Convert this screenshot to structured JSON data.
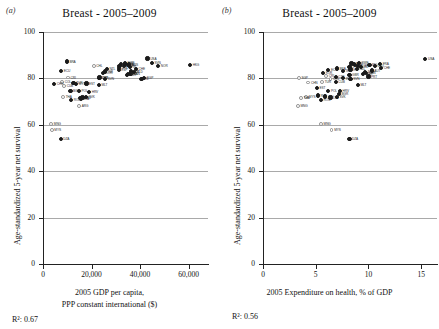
{
  "figure": {
    "panels": [
      {
        "letter": "(a)",
        "title": "Breast - 2005–2009",
        "rsq_text": "R²: 0.67",
        "xlabel_line1": "2005 GDP per capita,",
        "xlabel_line2": "PPP constant international ($)"
      },
      {
        "letter": "(b)",
        "title": "Breast - 2005–2009",
        "rsq_text": "R²: 0.56",
        "xlabel_line1": "2005 Expenditure on health, % of GDP",
        "xlabel_line2": ""
      }
    ],
    "ylabel": "Age-standardized 5-year net survival"
  },
  "chart_data": [
    {
      "type": "scatter",
      "panel": "a",
      "title": "Breast - 2005–2009",
      "xlabel": "2005 GDP per capita, PPP constant international ($)",
      "ylabel": "Age-standardized 5-year net survival",
      "xlim": [
        0,
        68000
      ],
      "ylim": [
        0,
        100
      ],
      "xticks": [
        0,
        20000,
        40000,
        60000
      ],
      "xtick_labels": [
        "0",
        "20,000",
        "40,000",
        "60,000"
      ],
      "yticks": [
        0,
        20,
        40,
        60,
        80,
        100
      ],
      "ytick_labels": [
        "0",
        "20",
        "40",
        "60",
        "80",
        "100"
      ],
      "grid": "horizontal",
      "legend": "none",
      "annotation": "R²: 0.67",
      "r_squared": 0.67,
      "points": [
        {
          "label": "BRA",
          "x": 9800,
          "y": 87.3,
          "marker": "filled"
        },
        {
          "label": "ECU",
          "x": 7500,
          "y": 83.2,
          "marker": "filled"
        },
        {
          "label": "CRI",
          "x": 10300,
          "y": 80.4,
          "marker": "open"
        },
        {
          "label": "COL",
          "x": 7900,
          "y": 78.5,
          "marker": "open"
        },
        {
          "label": "CHN",
          "x": 4600,
          "y": 77.5,
          "marker": "filled"
        },
        {
          "label": "CUB",
          "x": 8700,
          "y": 76.8,
          "marker": "open"
        },
        {
          "label": "TUR",
          "x": 12600,
          "y": 78.0,
          "marker": "filled"
        },
        {
          "label": "MYS",
          "x": 13700,
          "y": 77.6,
          "marker": "filled"
        },
        {
          "label": "EST",
          "x": 17900,
          "y": 77.8,
          "marker": "filled"
        },
        {
          "label": "POL",
          "x": 14800,
          "y": 74.5,
          "marker": "filled"
        },
        {
          "label": "BGR",
          "x": 11300,
          "y": 74.6,
          "marker": "filled"
        },
        {
          "label": "THA",
          "x": 8300,
          "y": 72.0,
          "marker": "open"
        },
        {
          "label": "RUS",
          "x": 15100,
          "y": 71.4,
          "marker": "filled"
        },
        {
          "label": "LVA",
          "x": 15700,
          "y": 71.0,
          "marker": "filled"
        },
        {
          "label": "LTU",
          "x": 16300,
          "y": 71.8,
          "marker": "filled"
        },
        {
          "label": "SVK",
          "x": 17800,
          "y": 71.9,
          "marker": "filled"
        },
        {
          "label": "ROU",
          "x": 11600,
          "y": 70.6,
          "marker": "filled"
        },
        {
          "label": "MNG",
          "x": 3400,
          "y": 60.2,
          "marker": "open"
        },
        {
          "label": "MYS",
          "x": 3600,
          "y": 57.9,
          "marker": "open"
        },
        {
          "label": "DZA",
          "x": 7300,
          "y": 53.8,
          "marker": "filled"
        },
        {
          "label": "ARG",
          "x": 14900,
          "y": 68.0,
          "marker": "open"
        },
        {
          "label": "CHL",
          "x": 20900,
          "y": 85.5,
          "marker": "open"
        },
        {
          "label": "KOR",
          "x": 24800,
          "y": 82.3,
          "marker": "filled"
        },
        {
          "label": "ISR",
          "x": 25700,
          "y": 83.0,
          "marker": "filled"
        },
        {
          "label": "CZE",
          "x": 23200,
          "y": 80.2,
          "marker": "filled"
        },
        {
          "label": "PRT",
          "x": 23300,
          "y": 80.4,
          "marker": "filled"
        },
        {
          "label": "SVN",
          "x": 25600,
          "y": 79.9,
          "marker": "filled"
        },
        {
          "label": "MLT",
          "x": 23000,
          "y": 77.2,
          "marker": "filled"
        },
        {
          "label": "HRV",
          "x": 19000,
          "y": 74.2,
          "marker": "filled"
        },
        {
          "label": "ESP",
          "x": 31200,
          "y": 83.6,
          "marker": "filled"
        },
        {
          "label": "ITA",
          "x": 31500,
          "y": 85.5,
          "marker": "filled"
        },
        {
          "label": "FRA",
          "x": 32000,
          "y": 86.1,
          "marker": "filled"
        },
        {
          "label": "DEU",
          "x": 33500,
          "y": 85.4,
          "marker": "filled"
        },
        {
          "label": "FIN",
          "x": 33900,
          "y": 86.3,
          "marker": "filled"
        },
        {
          "label": "GBR",
          "x": 34500,
          "y": 81.5,
          "marker": "filled"
        },
        {
          "label": "JPN",
          "x": 31400,
          "y": 84.6,
          "marker": "filled"
        },
        {
          "label": "BEL",
          "x": 35000,
          "y": 85.7,
          "marker": "filled"
        },
        {
          "label": "AUT",
          "x": 36200,
          "y": 83.0,
          "marker": "filled"
        },
        {
          "label": "NZL",
          "x": 26300,
          "y": 84.0,
          "marker": "filled"
        },
        {
          "label": "AUS",
          "x": 35500,
          "y": 86.0,
          "marker": "filled"
        },
        {
          "label": "CAN",
          "x": 36100,
          "y": 82.0,
          "marker": "filled"
        },
        {
          "label": "DNK",
          "x": 35200,
          "y": 81.8,
          "marker": "filled"
        },
        {
          "label": "NLD",
          "x": 37500,
          "y": 82.6,
          "marker": "filled"
        },
        {
          "label": "ISL",
          "x": 35800,
          "y": 84.9,
          "marker": "filled"
        },
        {
          "label": "CHE",
          "x": 38300,
          "y": 84.2,
          "marker": "filled"
        },
        {
          "label": "IRL",
          "x": 40600,
          "y": 79.9,
          "marker": "filled"
        },
        {
          "label": "SWE",
          "x": 33800,
          "y": 86.5,
          "marker": "filled"
        },
        {
          "label": "SVN",
          "x": 44900,
          "y": 86.6,
          "marker": "filled"
        },
        {
          "label": "USA",
          "x": 43100,
          "y": 88.6,
          "marker": "filled"
        },
        {
          "label": "NOR",
          "x": 47500,
          "y": 85.2,
          "marker": "filled"
        },
        {
          "label": "HKG",
          "x": 60600,
          "y": 85.9,
          "marker": "filled"
        },
        {
          "label": "SGP",
          "x": 41700,
          "y": 80.3,
          "marker": "filled"
        }
      ]
    },
    {
      "type": "scatter",
      "panel": "b",
      "title": "Breast - 2005–2009",
      "xlabel": "2005 Expenditure on health, % of GDP",
      "ylabel": "Age-standardized 5-year net survival",
      "xlim": [
        0,
        16.5
      ],
      "ylim": [
        0,
        100
      ],
      "xticks": [
        0,
        5,
        10,
        15
      ],
      "xtick_labels": [
        "0",
        "5",
        "10",
        "15"
      ],
      "yticks": [
        0,
        20,
        40,
        60,
        80,
        100
      ],
      "ytick_labels": [
        "0",
        "20",
        "40",
        "60",
        "80",
        "100"
      ],
      "grid": "horizontal",
      "legend": "none",
      "annotation": "R²: 0.56",
      "r_squared": 0.56,
      "points": [
        {
          "label": "USA",
          "x": 15.4,
          "y": 88.5,
          "marker": "filled"
        },
        {
          "label": "CHN",
          "x": 4.3,
          "y": 78.2,
          "marker": "open"
        },
        {
          "label": "CRI",
          "x": 6.0,
          "y": 81.2,
          "marker": "open"
        },
        {
          "label": "ECU",
          "x": 6.2,
          "y": 83.5,
          "marker": "filled"
        },
        {
          "label": "BRA",
          "x": 7.0,
          "y": 84.3,
          "marker": "filled"
        },
        {
          "label": "COL",
          "x": 6.4,
          "y": 79.6,
          "marker": "open"
        },
        {
          "label": "TUR",
          "x": 5.6,
          "y": 78.5,
          "marker": "open"
        },
        {
          "label": "CUB",
          "x": 6.9,
          "y": 78.6,
          "marker": "filled"
        },
        {
          "label": "MYS",
          "x": 4.1,
          "y": 72.0,
          "marker": "open"
        },
        {
          "label": "THA",
          "x": 3.6,
          "y": 71.6,
          "marker": "open"
        },
        {
          "label": "MNG",
          "x": 3.3,
          "y": 68.0,
          "marker": "open"
        },
        {
          "label": "EST",
          "x": 5.1,
          "y": 76.0,
          "marker": "filled"
        },
        {
          "label": "POL",
          "x": 6.2,
          "y": 74.5,
          "marker": "filled"
        },
        {
          "label": "RUS",
          "x": 5.2,
          "y": 72.6,
          "marker": "filled"
        },
        {
          "label": "LVA",
          "x": 6.4,
          "y": 71.8,
          "marker": "filled"
        },
        {
          "label": "LTU",
          "x": 5.9,
          "y": 72.2,
          "marker": "filled"
        },
        {
          "label": "ROU",
          "x": 5.5,
          "y": 70.8,
          "marker": "filled"
        },
        {
          "label": "BGR",
          "x": 7.2,
          "y": 73.4,
          "marker": "filled"
        },
        {
          "label": "SVK",
          "x": 7.0,
          "y": 72.0,
          "marker": "filled"
        },
        {
          "label": "KOR",
          "x": 5.7,
          "y": 82.4,
          "marker": "filled"
        },
        {
          "label": "ISR",
          "x": 7.6,
          "y": 83.2,
          "marker": "filled"
        },
        {
          "label": "CZE",
          "x": 6.9,
          "y": 80.6,
          "marker": "filled"
        },
        {
          "label": "JPN",
          "x": 8.2,
          "y": 84.8,
          "marker": "filled"
        },
        {
          "label": "SVN",
          "x": 8.3,
          "y": 79.8,
          "marker": "filled"
        },
        {
          "label": "MLT",
          "x": 9.0,
          "y": 77.0,
          "marker": "filled"
        },
        {
          "label": "HRV",
          "x": 7.3,
          "y": 74.4,
          "marker": "filled"
        },
        {
          "label": "ESP",
          "x": 8.3,
          "y": 83.8,
          "marker": "filled"
        },
        {
          "label": "ITA",
          "x": 8.7,
          "y": 85.6,
          "marker": "filled"
        },
        {
          "label": "FIN",
          "x": 8.4,
          "y": 86.4,
          "marker": "filled"
        },
        {
          "label": "AUS",
          "x": 8.6,
          "y": 86.2,
          "marker": "filled"
        },
        {
          "label": "GBR",
          "x": 8.2,
          "y": 81.4,
          "marker": "filled"
        },
        {
          "label": "NZL",
          "x": 8.9,
          "y": 84.1,
          "marker": "filled"
        },
        {
          "label": "IRL",
          "x": 7.6,
          "y": 80.0,
          "marker": "filled"
        },
        {
          "label": "SWE",
          "x": 9.1,
          "y": 86.8,
          "marker": "filled"
        },
        {
          "label": "NOR",
          "x": 9.0,
          "y": 85.4,
          "marker": "filled"
        },
        {
          "label": "CAN",
          "x": 9.8,
          "y": 82.2,
          "marker": "filled"
        },
        {
          "label": "DNK",
          "x": 9.5,
          "y": 81.9,
          "marker": "filled"
        },
        {
          "label": "NLD",
          "x": 9.7,
          "y": 82.8,
          "marker": "filled"
        },
        {
          "label": "ISL",
          "x": 9.3,
          "y": 85.0,
          "marker": "filled"
        },
        {
          "label": "PRT",
          "x": 10.0,
          "y": 80.8,
          "marker": "filled"
        },
        {
          "label": "DEU",
          "x": 10.6,
          "y": 85.5,
          "marker": "filled"
        },
        {
          "label": "BEL",
          "x": 10.1,
          "y": 85.8,
          "marker": "filled"
        },
        {
          "label": "AUT",
          "x": 10.3,
          "y": 83.4,
          "marker": "filled"
        },
        {
          "label": "CHE",
          "x": 11.2,
          "y": 84.4,
          "marker": "filled"
        },
        {
          "label": "FRA",
          "x": 11.1,
          "y": 86.2,
          "marker": "filled"
        },
        {
          "label": "SGP",
          "x": 3.4,
          "y": 80.2,
          "marker": "open"
        },
        {
          "label": "MNG",
          "x": 5.5,
          "y": 60.2,
          "marker": "open"
        },
        {
          "label": "MYS",
          "x": 6.5,
          "y": 57.8,
          "marker": "open"
        },
        {
          "label": "DZA",
          "x": 8.2,
          "y": 54.0,
          "marker": "filled"
        }
      ]
    }
  ]
}
